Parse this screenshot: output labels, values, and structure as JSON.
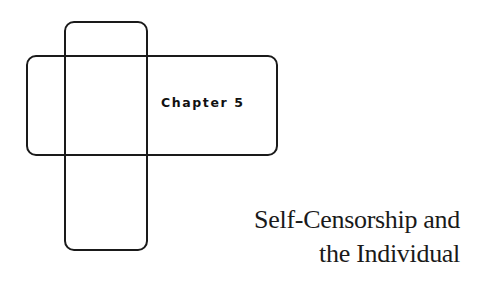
{
  "chapter": {
    "label": "Chapter 5"
  },
  "title": {
    "line1": "Self-Censorship and",
    "line2": "the Individual"
  },
  "decoration": {
    "shape": "cross-shaped-rounded-rectangles",
    "stroke_color": "#1a1a1a"
  }
}
